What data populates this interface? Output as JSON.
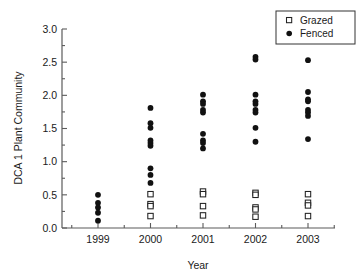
{
  "chart_data": {
    "type": "scatter",
    "title": "",
    "xlabel": "Year",
    "ylabel": "DCA 1 Plant Community",
    "categories": [
      "1999",
      "2000",
      "2001",
      "2002",
      "2003"
    ],
    "xtick_labels": [
      "1999",
      "2000",
      "2001",
      "2002",
      "2003"
    ],
    "ytick_labels": [
      "0.0",
      "0.5",
      "1.0",
      "1.5",
      "2.0",
      "2.5",
      "3.0"
    ],
    "yticks": [
      0.0,
      0.5,
      1.0,
      1.5,
      2.0,
      2.5,
      3.0
    ],
    "ylim": [
      0.0,
      3.0
    ],
    "xlim": [
      1998.5,
      2003.6
    ],
    "grid": false,
    "legend_position": "top-right",
    "legend": [
      {
        "name": "Grazed",
        "marker": "open-square",
        "color": "#ffffff",
        "edge": "#222222"
      },
      {
        "name": "Fenced",
        "marker": "filled-circle",
        "color": "#111111"
      }
    ],
    "series": [
      {
        "name": "Grazed",
        "marker": "open-square",
        "points": [
          {
            "x": "1999",
            "values": []
          },
          {
            "x": "2000",
            "values": [
              0.51,
              0.36,
              0.33,
              0.18
            ]
          },
          {
            "x": "2001",
            "values": [
              0.55,
              0.51,
              0.33,
              0.19
            ]
          },
          {
            "x": "2002",
            "values": [
              0.53,
              0.5,
              0.31,
              0.28,
              0.17
            ]
          },
          {
            "x": "2003",
            "values": [
              0.51,
              0.38,
              0.34,
              0.18
            ]
          }
        ]
      },
      {
        "name": "Fenced",
        "marker": "filled-circle",
        "points": [
          {
            "x": "1999",
            "values": [
              0.5,
              0.38,
              0.31,
              0.23,
              0.11
            ]
          },
          {
            "x": "2000",
            "values": [
              1.81,
              1.58,
              1.51,
              1.32,
              1.28,
              1.24,
              0.9,
              0.8,
              0.68
            ]
          },
          {
            "x": "2001",
            "values": [
              2.01,
              1.91,
              1.87,
              1.78,
              1.74,
              1.42,
              1.32,
              1.28,
              1.2
            ]
          },
          {
            "x": "2002",
            "values": [
              2.58,
              2.54,
              2.01,
              1.91,
              1.87,
              1.78,
              1.74,
              1.51,
              1.3
            ]
          },
          {
            "x": "2003",
            "values": [
              2.53,
              2.05,
              1.94,
              1.91,
              1.78,
              1.74,
              1.69,
              1.34
            ]
          }
        ]
      }
    ]
  }
}
